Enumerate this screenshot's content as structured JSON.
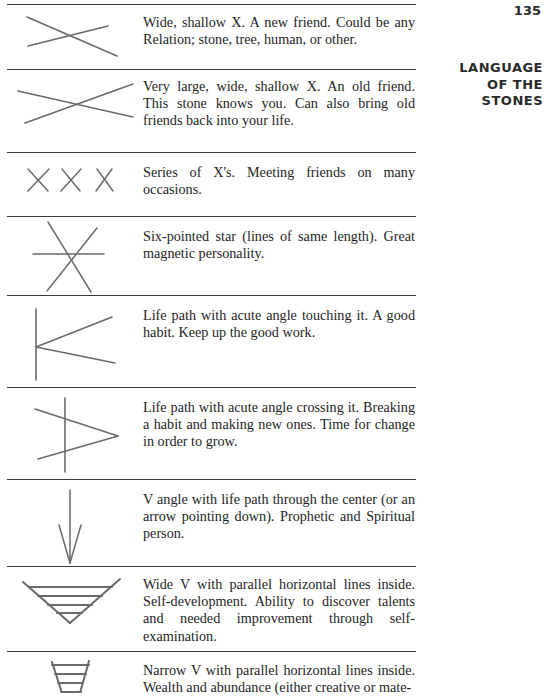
{
  "page": {
    "number": "135",
    "running_head": [
      "LANGUAGE",
      "OF THE",
      "STONES"
    ]
  },
  "entries": [
    {
      "symbol": "wide-shallow-x-icon",
      "text": "Wide, shallow X. A new friend. Could be any Relation; stone, tree, human, or other."
    },
    {
      "symbol": "very-large-shallow-x-icon",
      "text": "Very large, wide, shallow X. An old friend. This stone knows you. Can also bring old friends back into your life."
    },
    {
      "symbol": "series-of-x-icon",
      "text": "Series of X's. Meeting friends on many occasions."
    },
    {
      "symbol": "six-pointed-star-icon",
      "text": "Six-pointed star (lines of same length). Great magnetic personality."
    },
    {
      "symbol": "life-path-acute-angle-touching-icon",
      "text": "Life path with acute angle touching it. A good habit. Keep up the good work."
    },
    {
      "symbol": "life-path-acute-angle-crossing-icon",
      "text": "Life path with acute angle crossing it. Breaking a habit and making new ones. Time for change in order to grow."
    },
    {
      "symbol": "v-angle-life-path-arrow-icon",
      "text": "V angle with life path through the center (or an arrow pointing down). Prophetic and Spiritual person."
    },
    {
      "symbol": "wide-v-horizontal-lines-icon",
      "text": "Wide V with parallel horizontal lines inside. Self-development. Ability to discover talents and needed improvement through self-examination."
    },
    {
      "symbol": "narrow-v-horizontal-lines-icon",
      "text": "Narrow V with parallel horizontal lines inside. Wealth and abundance (either creative or mate-"
    }
  ],
  "colors": {
    "ink": "#1e1e1e",
    "drawing": "#6a6a6a",
    "rule": "#3a3a3a"
  }
}
